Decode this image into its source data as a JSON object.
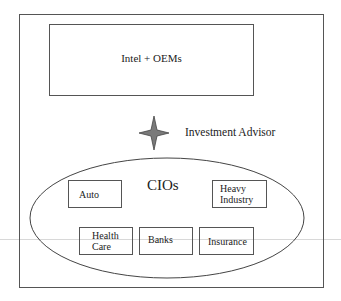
{
  "diagram": {
    "top_box": {
      "label": "Intel + OEMs"
    },
    "advisor": {
      "label": "Investment Advisor",
      "icon": "four-point-star-icon",
      "color": "#6e6e6e"
    },
    "group": {
      "label": "CIOs",
      "items": [
        {
          "label": "Auto"
        },
        {
          "label": "Heavy\nIndustry"
        },
        {
          "label": "Health\nCare"
        },
        {
          "label": "Banks"
        },
        {
          "label": "Insurance"
        }
      ]
    }
  }
}
